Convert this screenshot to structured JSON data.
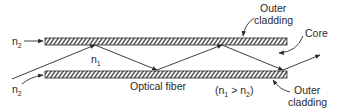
{
  "diagram": {
    "title": "Optical fiber",
    "condition": "(n₁ > n₂)",
    "labels": {
      "n2_top": "n",
      "n2_top_sub": "2",
      "n2_bottom": "n",
      "n2_bottom_sub": "2",
      "n1": "n",
      "n1_sub": "1",
      "outer_cladding_top_line1": "Outer",
      "outer_cladding_top_line2": "cladding",
      "core": "Core",
      "outer_cladding_bottom_line1": "Outer",
      "outer_cladding_bottom_line2": "cladding",
      "optical_fiber": "Optical fiber",
      "condition_open": "(n",
      "condition_sub1": "1",
      "condition_mid": " > n",
      "condition_sub2": "2",
      "condition_close": ")"
    },
    "colors": {
      "line": "#2a2a2a",
      "background": "#ffffff"
    }
  }
}
